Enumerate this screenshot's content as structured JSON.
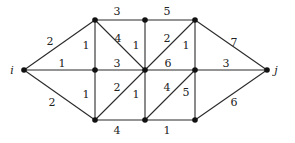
{
  "diagram": {
    "type": "weighted-graph",
    "colors": {
      "edge": "#2a2a2a",
      "node": "#111111",
      "text": "#222222"
    },
    "nodes": [
      {
        "id": "i",
        "label": "i",
        "x": 24,
        "y": 70,
        "lx": 12,
        "ly": 74
      },
      {
        "id": "A",
        "label": "",
        "x": 95,
        "y": 20
      },
      {
        "id": "B",
        "label": "",
        "x": 145,
        "y": 20
      },
      {
        "id": "C",
        "label": "",
        "x": 195,
        "y": 20
      },
      {
        "id": "D",
        "label": "",
        "x": 95,
        "y": 70
      },
      {
        "id": "E",
        "label": "",
        "x": 145,
        "y": 70
      },
      {
        "id": "F",
        "label": "",
        "x": 195,
        "y": 70
      },
      {
        "id": "G",
        "label": "",
        "x": 95,
        "y": 120
      },
      {
        "id": "H",
        "label": "",
        "x": 145,
        "y": 120
      },
      {
        "id": "K",
        "label": "",
        "x": 195,
        "y": 120
      },
      {
        "id": "j",
        "label": "j",
        "x": 267,
        "y": 70,
        "lx": 276,
        "ly": 74
      }
    ],
    "edges": [
      {
        "from": "i",
        "to": "A",
        "weight": "2",
        "lx": 50,
        "ly": 45
      },
      {
        "from": "i",
        "to": "D",
        "weight": "1",
        "lx": 62,
        "ly": 67
      },
      {
        "from": "i",
        "to": "G",
        "weight": "2",
        "lx": 52,
        "ly": 106
      },
      {
        "from": "A",
        "to": "B",
        "weight": "3",
        "lx": 117,
        "ly": 15
      },
      {
        "from": "B",
        "to": "C",
        "weight": "5",
        "lx": 167,
        "ly": 15
      },
      {
        "from": "A",
        "to": "D",
        "weight": "1",
        "lx": 86,
        "ly": 49
      },
      {
        "from": "A",
        "to": "E",
        "weight": "4",
        "lx": 118,
        "ly": 42
      },
      {
        "from": "B",
        "to": "E",
        "weight": "1",
        "lx": 136,
        "ly": 49
      },
      {
        "from": "C",
        "to": "E",
        "weight": "2",
        "lx": 167,
        "ly": 42
      },
      {
        "from": "C",
        "to": "F",
        "weight": "1",
        "lx": 186,
        "ly": 49
      },
      {
        "from": "C",
        "to": "j",
        "weight": "7",
        "lx": 234,
        "ly": 46
      },
      {
        "from": "D",
        "to": "E",
        "weight": "3",
        "lx": 117,
        "ly": 67
      },
      {
        "from": "E",
        "to": "F",
        "weight": "6",
        "lx": 168,
        "ly": 67
      },
      {
        "from": "F",
        "to": "j",
        "weight": "3",
        "lx": 226,
        "ly": 67
      },
      {
        "from": "D",
        "to": "G",
        "weight": "1",
        "lx": 86,
        "ly": 98
      },
      {
        "from": "G",
        "to": "E",
        "weight": "2",
        "lx": 117,
        "ly": 91
      },
      {
        "from": "E",
        "to": "H",
        "weight": "1",
        "lx": 136,
        "ly": 98
      },
      {
        "from": "H",
        "to": "F",
        "weight": "4",
        "lx": 167,
        "ly": 91
      },
      {
        "from": "F",
        "to": "K",
        "weight": "5",
        "lx": 186,
        "ly": 96
      },
      {
        "from": "K",
        "to": "j",
        "weight": "6",
        "lx": 234,
        "ly": 106
      },
      {
        "from": "G",
        "to": "H",
        "weight": "4",
        "lx": 117,
        "ly": 134
      },
      {
        "from": "H",
        "to": "K",
        "weight": "1",
        "lx": 167,
        "ly": 134
      }
    ]
  }
}
